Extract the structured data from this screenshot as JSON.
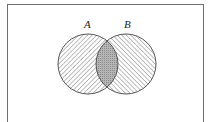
{
  "diagram": {
    "type": "venn",
    "sets": [
      {
        "label": "A",
        "hatch": "diagonal-forward"
      },
      {
        "label": "B",
        "hatch": "diagonal-backward"
      }
    ],
    "intersection": {
      "shading": "dotted-dark"
    },
    "colors": {
      "outline": "#555555",
      "hatch": "#8a8a8a",
      "intersection": "#a8a8a8",
      "frame": "#6e6e6e"
    }
  }
}
